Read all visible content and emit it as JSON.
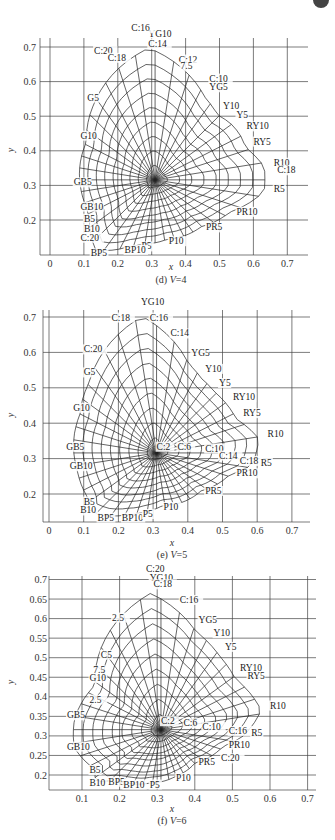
{
  "chart_data": [
    {
      "type": "line",
      "title": "(d) V=4",
      "caption_prefix": "(d) ",
      "caption_var": "V",
      "caption_value": "=4",
      "xlabel": "x",
      "ylabel": "y",
      "xlim": [
        0,
        0.7
      ],
      "ylim": [
        0.1,
        0.7
      ],
      "grid": true,
      "x_ticks": [
        "0",
        "0.1",
        "0.2",
        "0.3",
        "0.4",
        "0.5",
        "0.6",
        "0.7"
      ],
      "y_ticks": [
        "0.7",
        "0.6",
        "0.5",
        "0.4",
        "0.3",
        "0.2"
      ],
      "white_point": {
        "x": 0.31,
        "y": 0.316
      },
      "chroma_labels": [
        "C:2",
        "C:6",
        "C:10",
        "C:12",
        "C:14",
        "C:16",
        "C:18",
        "C:20"
      ],
      "hue_labels": [
        {
          "text": "YG10",
          "x": 0.29,
          "y": 0.73
        },
        {
          "text": "C:16",
          "x": 0.24,
          "y": 0.745
        },
        {
          "text": "C:14",
          "x": 0.29,
          "y": 0.7
        },
        {
          "text": "C:20",
          "x": 0.13,
          "y": 0.68
        },
        {
          "text": "C:18",
          "x": 0.17,
          "y": 0.66
        },
        {
          "text": "C:12",
          "x": 0.38,
          "y": 0.655
        },
        {
          "text": "7.5",
          "x": 0.385,
          "y": 0.635
        },
        {
          "text": "C:10",
          "x": 0.47,
          "y": 0.6
        },
        {
          "text": "YG5",
          "x": 0.47,
          "y": 0.575
        },
        {
          "text": "G5",
          "x": 0.11,
          "y": 0.545
        },
        {
          "text": "Y10",
          "x": 0.51,
          "y": 0.52
        },
        {
          "text": "Y5",
          "x": 0.55,
          "y": 0.495
        },
        {
          "text": "RY10",
          "x": 0.58,
          "y": 0.462
        },
        {
          "text": "G10",
          "x": 0.09,
          "y": 0.435
        },
        {
          "text": "RY5",
          "x": 0.6,
          "y": 0.418
        },
        {
          "text": "R10",
          "x": 0.66,
          "y": 0.357
        },
        {
          "text": "C:18",
          "x": 0.67,
          "y": 0.335
        },
        {
          "text": "GB5",
          "x": 0.07,
          "y": 0.3
        },
        {
          "text": "R5",
          "x": 0.66,
          "y": 0.28
        },
        {
          "text": "GB10",
          "x": 0.09,
          "y": 0.23
        },
        {
          "text": "PR10",
          "x": 0.55,
          "y": 0.215
        },
        {
          "text": "PR5",
          "x": 0.46,
          "y": 0.17
        },
        {
          "text": "B5",
          "x": 0.1,
          "y": 0.195
        },
        {
          "text": "B10",
          "x": 0.1,
          "y": 0.165
        },
        {
          "text": "P10",
          "x": 0.35,
          "y": 0.13
        },
        {
          "text": "C:20",
          "x": 0.09,
          "y": 0.14
        },
        {
          "text": "P5",
          "x": 0.27,
          "y": 0.115
        },
        {
          "text": "BP10",
          "x": 0.22,
          "y": 0.105
        },
        {
          "text": "BP5",
          "x": 0.12,
          "y": 0.095
        }
      ]
    },
    {
      "type": "line",
      "title": "(e) V=5",
      "caption_prefix": "(e) ",
      "caption_var": "V",
      "caption_value": "=5",
      "xlabel": "x",
      "ylabel": "y",
      "xlim": [
        0,
        0.7
      ],
      "ylim": [
        0.12,
        0.7
      ],
      "grid": true,
      "x_ticks": [
        "0",
        "0.1",
        "0.2",
        "0.3",
        "0.4",
        "0.5",
        "0.6",
        "0.7"
      ],
      "y_ticks": [
        "0.7",
        "0.6",
        "0.5",
        "0.4",
        "0.3",
        "0.2"
      ],
      "white_point": {
        "x": 0.31,
        "y": 0.316
      },
      "chroma_labels": [
        "C:2",
        "C:6",
        "C:10",
        "C:14",
        "C:16",
        "C:18",
        "C:20"
      ],
      "hue_labels": [
        {
          "text": "YG10",
          "x": 0.265,
          "y": 0.735
        },
        {
          "text": "C:18",
          "x": 0.18,
          "y": 0.69
        },
        {
          "text": "C:16",
          "x": 0.29,
          "y": 0.69
        },
        {
          "text": "C:14",
          "x": 0.35,
          "y": 0.645
        },
        {
          "text": "C:20",
          "x": 0.1,
          "y": 0.6
        },
        {
          "text": "YG5",
          "x": 0.41,
          "y": 0.59
        },
        {
          "text": "G5",
          "x": 0.1,
          "y": 0.535
        },
        {
          "text": "Y10",
          "x": 0.45,
          "y": 0.545
        },
        {
          "text": "Y5",
          "x": 0.49,
          "y": 0.505
        },
        {
          "text": "RY10",
          "x": 0.53,
          "y": 0.465
        },
        {
          "text": "G10",
          "x": 0.07,
          "y": 0.435
        },
        {
          "text": "RY5",
          "x": 0.56,
          "y": 0.42
        },
        {
          "text": "R10",
          "x": 0.63,
          "y": 0.36
        },
        {
          "text": "GB5",
          "x": 0.05,
          "y": 0.325
        },
        {
          "text": "C:2",
          "x": 0.31,
          "y": 0.325
        },
        {
          "text": "C:6",
          "x": 0.37,
          "y": 0.325
        },
        {
          "text": "C:10",
          "x": 0.45,
          "y": 0.32
        },
        {
          "text": "C:14",
          "x": 0.49,
          "y": 0.3
        },
        {
          "text": "C:18",
          "x": 0.55,
          "y": 0.285
        },
        {
          "text": "R5",
          "x": 0.61,
          "y": 0.28
        },
        {
          "text": "GB10",
          "x": 0.06,
          "y": 0.27
        },
        {
          "text": "PR10",
          "x": 0.54,
          "y": 0.25
        },
        {
          "text": "PR5",
          "x": 0.45,
          "y": 0.2
        },
        {
          "text": "B5",
          "x": 0.1,
          "y": 0.17
        },
        {
          "text": "B10",
          "x": 0.09,
          "y": 0.145
        },
        {
          "text": "P10",
          "x": 0.33,
          "y": 0.155
        },
        {
          "text": "BP5",
          "x": 0.14,
          "y": 0.125
        },
        {
          "text": "BP10",
          "x": 0.21,
          "y": 0.125
        },
        {
          "text": "P5",
          "x": 0.27,
          "y": 0.135
        }
      ]
    },
    {
      "type": "line",
      "title": "(f) V=6",
      "caption_prefix": "(f) ",
      "caption_var": "V",
      "caption_value": "=6",
      "xlabel": "x",
      "ylabel": "y",
      "xlim": [
        0.02,
        0.72
      ],
      "ylim": [
        0.16,
        0.71
      ],
      "grid": true,
      "x_ticks": [
        "0.1",
        "0.2",
        "0.3",
        "0.4",
        "0.5",
        "0.6",
        "0.7"
      ],
      "y_ticks": [
        "0.7",
        "0.65",
        "0.6",
        "0.55",
        "0.5",
        "0.45",
        "0.4",
        "0.35",
        "0.3",
        "0.25",
        "0.2"
      ],
      "white_point": {
        "x": 0.31,
        "y": 0.316
      },
      "chroma_labels": [
        "C:2",
        "C:6",
        "C:10",
        "C:16",
        "C:18",
        "C:20",
        "2.5",
        "C5",
        "7.5"
      ],
      "hue_labels": [
        {
          "text": "C:20",
          "x": 0.27,
          "y": 0.72
        },
        {
          "text": "YG10",
          "x": 0.28,
          "y": 0.695
        },
        {
          "text": "C:18",
          "x": 0.29,
          "y": 0.68
        },
        {
          "text": "C:16",
          "x": 0.36,
          "y": 0.64
        },
        {
          "text": "2.5",
          "x": 0.18,
          "y": 0.595
        },
        {
          "text": "YG5",
          "x": 0.41,
          "y": 0.59
        },
        {
          "text": "Y10",
          "x": 0.45,
          "y": 0.555
        },
        {
          "text": "C5",
          "x": 0.15,
          "y": 0.5
        },
        {
          "text": "Y5",
          "x": 0.48,
          "y": 0.52
        },
        {
          "text": "7.5",
          "x": 0.13,
          "y": 0.46
        },
        {
          "text": "RY10",
          "x": 0.52,
          "y": 0.465
        },
        {
          "text": "G10",
          "x": 0.12,
          "y": 0.44
        },
        {
          "text": "RY5",
          "x": 0.54,
          "y": 0.445
        },
        {
          "text": "2.5",
          "x": 0.12,
          "y": 0.385
        },
        {
          "text": "R10",
          "x": 0.6,
          "y": 0.37
        },
        {
          "text": "GB5",
          "x": 0.06,
          "y": 0.345
        },
        {
          "text": "C:2",
          "x": 0.31,
          "y": 0.33
        },
        {
          "text": "C:6",
          "x": 0.37,
          "y": 0.325
        },
        {
          "text": "C:10",
          "x": 0.42,
          "y": 0.315
        },
        {
          "text": "C:16",
          "x": 0.49,
          "y": 0.305
        },
        {
          "text": "R5",
          "x": 0.55,
          "y": 0.3
        },
        {
          "text": "PR10",
          "x": 0.49,
          "y": 0.27
        },
        {
          "text": "GB10",
          "x": 0.06,
          "y": 0.265
        },
        {
          "text": "C:20",
          "x": 0.47,
          "y": 0.235
        },
        {
          "text": "PR5",
          "x": 0.41,
          "y": 0.225
        },
        {
          "text": "B5",
          "x": 0.12,
          "y": 0.205
        },
        {
          "text": "P10",
          "x": 0.35,
          "y": 0.185
        },
        {
          "text": "B10",
          "x": 0.12,
          "y": 0.172
        },
        {
          "text": "BP5",
          "x": 0.17,
          "y": 0.175
        },
        {
          "text": "BP10",
          "x": 0.21,
          "y": 0.168
        },
        {
          "text": "P5",
          "x": 0.28,
          "y": 0.168
        }
      ]
    }
  ],
  "charts": [
    {
      "caption": "(d) V=4",
      "cap_prefix": "(d) ",
      "cap_var": "V",
      "cap_val": "=4",
      "xlabel": "x",
      "ylabel": "y"
    },
    {
      "caption": "(e) V=5",
      "cap_prefix": "(e) ",
      "cap_var": "V",
      "cap_val": "=5",
      "xlabel": "x",
      "ylabel": "y"
    },
    {
      "caption": "(f) V=6",
      "cap_prefix": "(f) ",
      "cap_var": "V",
      "cap_val": "=6",
      "xlabel": "x",
      "ylabel": "y"
    }
  ],
  "colors": {
    "line": "#222222",
    "grid": "#444444",
    "background": "#ffffff"
  }
}
